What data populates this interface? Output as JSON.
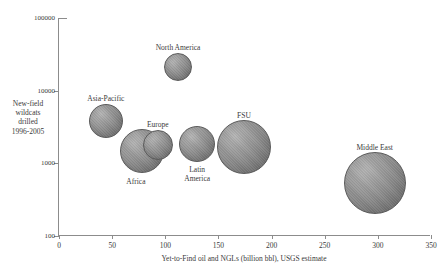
{
  "chart_data": {
    "type": "scatter",
    "title": "",
    "xlabel": "Yet-to-Find oil and NGLs (billion bbl), USGS estimate",
    "ylabel_lines": [
      "New-field",
      "wildcats",
      "drilled",
      "1996-2005"
    ],
    "xlim": [
      0,
      350
    ],
    "ylim": [
      100,
      100000
    ],
    "yscale": "log",
    "xscale": "linear",
    "grid": false,
    "legend": "none",
    "xticks": [
      "0",
      "50",
      "100",
      "150",
      "200",
      "250",
      "300",
      "350"
    ],
    "xtick_values": [
      0,
      50,
      100,
      150,
      200,
      250,
      300,
      350
    ],
    "yticks": [
      "100000",
      "10000",
      "1000",
      "100"
    ],
    "ytick_values": [
      100000,
      10000,
      1000,
      100
    ],
    "bubble_color": "#8a8a8a",
    "points": [
      {
        "name": "North America",
        "label": "North America",
        "x": 112,
        "y": 21000,
        "radius_px": 14,
        "label_pos": "top",
        "label_dx": 0,
        "label_dy": -24
      },
      {
        "name": "Asia-Pacific",
        "label": "Asia-Pacific",
        "x": 44,
        "y": 3800,
        "radius_px": 17,
        "label_pos": "top",
        "label_dx": 0,
        "label_dy": -27
      },
      {
        "name": "Europe",
        "label": "Europe",
        "x": 93,
        "y": 1780,
        "radius_px": 15,
        "label_pos": "top",
        "label_dx": 0,
        "label_dy": -25
      },
      {
        "name": "Africa",
        "label": "Africa",
        "x": 78,
        "y": 1500,
        "radius_px": 22,
        "label_pos": "bottom",
        "label_dx": -6,
        "label_dy": 26
      },
      {
        "name": "Latin America",
        "label": "Latin\nAmerica",
        "x": 130,
        "y": 1850,
        "radius_px": 18,
        "label_pos": "bottom",
        "label_dx": 0,
        "label_dy": 21
      },
      {
        "name": "FSU",
        "label": "FSU",
        "x": 174,
        "y": 1700,
        "radius_px": 27,
        "label_pos": "top",
        "label_dx": 0,
        "label_dy": -36
      },
      {
        "name": "Middle East",
        "label": "Middle East",
        "x": 297,
        "y": 530,
        "radius_px": 31,
        "label_pos": "top",
        "label_dx": 0,
        "label_dy": -40
      }
    ]
  }
}
